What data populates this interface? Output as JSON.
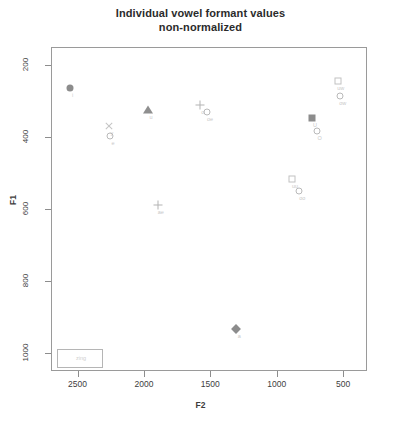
{
  "chart": {
    "title_line1": "Individual vowel formant values",
    "title_line2": "non-normalized",
    "xlabel": "F2",
    "ylabel": "F1",
    "legend_text": "zing"
  },
  "chart_data": {
    "type": "scatter",
    "title": "Individual vowel formant values non-normalized",
    "xlabel": "F2",
    "ylabel": "F1",
    "xlim": [
      2700,
      320
    ],
    "ylim": [
      1050,
      150
    ],
    "x_ticks": [
      2500,
      2000,
      1500,
      1000,
      500
    ],
    "y_ticks": [
      200,
      400,
      600,
      800,
      1000
    ],
    "x_tick_labels": [
      "2500",
      "2000",
      "1500",
      "1000",
      "500"
    ],
    "y_tick_labels": [
      "200",
      "400",
      "600",
      "800",
      "1000"
    ],
    "x_axis_reversed": true,
    "y_axis_reversed": true,
    "grid": false,
    "legend_position": "bottom-left",
    "legend_entries": [
      "zing"
    ],
    "points": [
      {
        "x": 2560,
        "y": 263,
        "marker": "circle",
        "label": "i"
      },
      {
        "x": 2265,
        "y": 369,
        "marker": "cross",
        "label": "y"
      },
      {
        "x": 2255,
        "y": 397,
        "marker": "circle-open",
        "label": "e"
      },
      {
        "x": 1970,
        "y": 325,
        "marker": "triangle",
        "label": "u"
      },
      {
        "x": 1580,
        "y": 310,
        "marker": "plus",
        "label": "o"
      },
      {
        "x": 1525,
        "y": 330,
        "marker": "circle-open",
        "label": "oe"
      },
      {
        "x": 1895,
        "y": 589,
        "marker": "plus",
        "label": "ae"
      },
      {
        "x": 1305,
        "y": 934,
        "marker": "diamond",
        "label": "a"
      },
      {
        "x": 885,
        "y": 518,
        "marker": "square-open",
        "label": "uu"
      },
      {
        "x": 830,
        "y": 550,
        "marker": "circle-open",
        "label": "oo"
      },
      {
        "x": 735,
        "y": 347,
        "marker": "square",
        "label": "U"
      },
      {
        "x": 700,
        "y": 382,
        "marker": "circle-open",
        "label": "O"
      },
      {
        "x": 540,
        "y": 245,
        "marker": "square-open",
        "label": "uw"
      },
      {
        "x": 525,
        "y": 285,
        "marker": "circle-open",
        "label": "ow"
      }
    ]
  }
}
